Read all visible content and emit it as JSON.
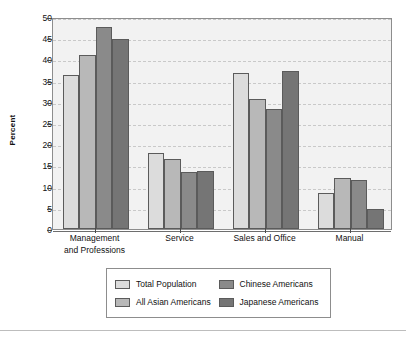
{
  "chart_data": {
    "type": "bar",
    "title": "",
    "xlabel": "",
    "ylabel": "Percent",
    "ylim": [
      0,
      50
    ],
    "ytick_step": 5,
    "yticks": [
      0,
      5,
      10,
      15,
      20,
      25,
      30,
      35,
      40,
      45,
      50
    ],
    "grid": true,
    "legend_position": "bottom",
    "categories": [
      "Management\nand Professions",
      "Service",
      "Sales and Office",
      "Manual"
    ],
    "category_labels": [
      [
        "Management",
        "and Professions"
      ],
      [
        "Service"
      ],
      [
        "Sales and Office"
      ],
      [
        "Manual"
      ]
    ],
    "series": [
      {
        "name": "Total Population",
        "color": "#dcdcdc",
        "values": [
          36.3,
          18.0,
          36.9,
          8.6
        ]
      },
      {
        "name": "All Asian Americans",
        "color": "#b8b8b8",
        "values": [
          41.0,
          16.6,
          30.7,
          12.1
        ]
      },
      {
        "name": "Chinese Americans",
        "color": "#8a8a8a",
        "values": [
          47.6,
          13.4,
          28.2,
          11.5
        ]
      },
      {
        "name": "Japanese Americans",
        "color": "#757575",
        "values": [
          44.9,
          13.8,
          37.3,
          4.7
        ]
      }
    ]
  },
  "legend": {
    "entries": [
      {
        "label": "Total Population",
        "color": "#dcdcdc"
      },
      {
        "label": "Chinese Americans",
        "color": "#8a8a8a"
      },
      {
        "label": "All Asian Americans",
        "color": "#b8b8b8"
      },
      {
        "label": "Japanese Americans",
        "color": "#757575"
      }
    ]
  },
  "colors": {
    "plot_background": "#f2f2f2",
    "axis": "#8d8d8d",
    "gridline": "#c9c9c9",
    "bar_outline": "#5b5b5b",
    "text": "#111111"
  }
}
